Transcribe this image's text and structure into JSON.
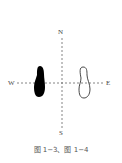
{
  "compass": {
    "north": "N",
    "south": "S",
    "west": "W",
    "east": "E"
  },
  "footprints": [
    {
      "name": "left-footprint",
      "style": "filled",
      "color": "#000000"
    },
    {
      "name": "right-footprint",
      "style": "outline",
      "color": "#333333"
    }
  ],
  "axis_style": {
    "line": "dashed",
    "color": "#666666"
  },
  "caption": "图 1−3、图 1−4"
}
